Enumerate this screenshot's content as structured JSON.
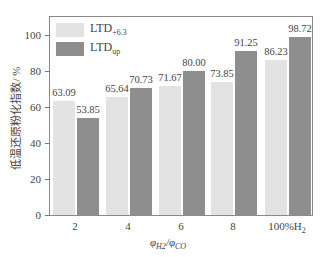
{
  "chart_data": {
    "type": "bar",
    "title": "",
    "xlabel": "φH2/φCO",
    "ylabel": "低温还原粉化指数/ %",
    "categories": [
      "2",
      "4",
      "6",
      "8",
      "100%H2"
    ],
    "series": [
      {
        "name": "LTD+6.3",
        "color": "#e3e3e3",
        "values": [
          63.09,
          65.64,
          71.67,
          73.85,
          86.23
        ]
      },
      {
        "name": "LTDup",
        "color": "#8e8e8e",
        "values": [
          53.85,
          70.73,
          80.0,
          91.25,
          98.72
        ]
      }
    ],
    "ylim": [
      0,
      110
    ],
    "yticks": [
      0,
      20,
      40,
      60,
      80,
      100
    ],
    "grid": false,
    "legend_position": "upper left"
  },
  "labels": {
    "y_title": "低温还原粉化指数/ %",
    "x_title_main": "φ",
    "x_title_sub1": "H2",
    "x_title_sep": "/φ",
    "x_title_sub2": "CO",
    "legend_1_main": "LTD",
    "legend_1_sub": "+6.3",
    "legend_2_main": "LTD",
    "legend_2_sub": "up",
    "x_cats": [
      "2",
      "4",
      "6",
      "8",
      "100%H"
    ],
    "x_last_sub": "2",
    "y_ticks": [
      "0",
      "20",
      "40",
      "60",
      "80",
      "100"
    ],
    "light_vals": [
      "63.09",
      "65.64",
      "71.67",
      "73.85",
      "86.23"
    ],
    "dark_vals": [
      "53.85",
      "70.73",
      "80.00",
      "91.25",
      "98.72"
    ]
  }
}
